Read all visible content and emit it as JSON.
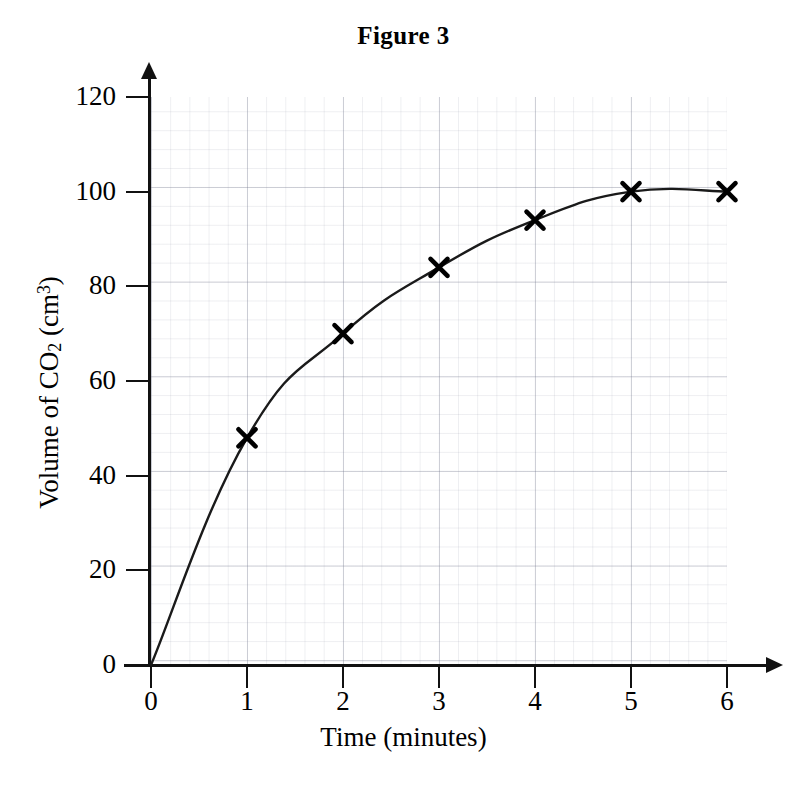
{
  "figure": {
    "title": "Figure 3"
  },
  "chart_data": {
    "type": "line",
    "title": "Figure 3",
    "xlabel": "Time (minutes)",
    "ylabel": "Volume of CO2 (cm3)",
    "ylabel_parts": {
      "prefix": "Volume of CO",
      "sub": "2",
      "middle": " (cm",
      "sup": "3",
      "suffix": ")"
    },
    "x": [
      0,
      1,
      2,
      3,
      4,
      5,
      6
    ],
    "values": [
      0,
      48,
      70,
      84,
      94,
      100,
      100
    ],
    "markers": [
      {
        "x": 1,
        "y": 48
      },
      {
        "x": 2,
        "y": 70
      },
      {
        "x": 3,
        "y": 84
      },
      {
        "x": 4,
        "y": 94
      },
      {
        "x": 5,
        "y": 100
      },
      {
        "x": 6,
        "y": 100
      }
    ],
    "marker_style": "x-cross",
    "xlim": [
      0,
      6
    ],
    "ylim": [
      0,
      126
    ],
    "xticks": [
      "0",
      "1",
      "2",
      "3",
      "4",
      "5",
      "6"
    ],
    "yticks": [
      "0",
      "20",
      "40",
      "60",
      "80",
      "100",
      "120"
    ],
    "grid": true,
    "grid_style": "graph-paper",
    "legend": null,
    "line_color": "#1a1a1a",
    "marker_color": "#000000",
    "grid_color": "#787d91",
    "axis_color": "#111111",
    "background": "#ffffff"
  }
}
